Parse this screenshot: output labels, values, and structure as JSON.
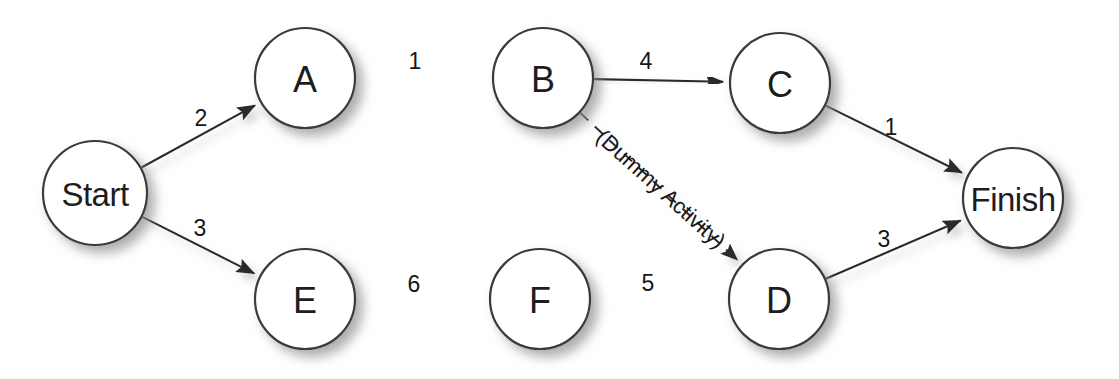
{
  "diagram": {
    "type": "project-network-diagram",
    "title": "",
    "background_color": "#ffffff",
    "node_fill": "#ffffff",
    "node_stroke": "#3a3a3a",
    "edge_color": "#2b2b2b",
    "nodes": [
      {
        "id": "start",
        "label": "Start",
        "cx": 95,
        "cy": 193,
        "r": 52,
        "label_style": "word"
      },
      {
        "id": "a",
        "label": "A",
        "cx": 305,
        "cy": 78,
        "r": 50,
        "label_style": "big"
      },
      {
        "id": "b",
        "label": "B",
        "cx": 543,
        "cy": 78,
        "r": 50,
        "label_style": "big"
      },
      {
        "id": "c",
        "label": "C",
        "cx": 780,
        "cy": 83,
        "r": 50,
        "label_style": "big"
      },
      {
        "id": "e",
        "label": "E",
        "cx": 305,
        "cy": 299,
        "r": 50,
        "label_style": "big"
      },
      {
        "id": "f",
        "label": "F",
        "cx": 540,
        "cy": 299,
        "r": 50,
        "label_style": "big"
      },
      {
        "id": "d",
        "label": "D",
        "cx": 779,
        "cy": 299,
        "r": 50,
        "label_style": "big"
      },
      {
        "id": "finish",
        "label": "Finish",
        "cx": 1013,
        "cy": 198,
        "r": 50,
        "label_style": "word"
      }
    ],
    "edges": [
      {
        "id": "start-a",
        "from": "start",
        "to": "a",
        "label": "2",
        "label_x": 201,
        "label_y": 118,
        "style": "solid"
      },
      {
        "id": "a-b",
        "from": "a",
        "to": "b",
        "label": "1",
        "label_x": 415,
        "label_y": 61,
        "style": "solid"
      },
      {
        "id": "b-c",
        "from": "b",
        "to": "c",
        "label": "4",
        "label_x": 646,
        "label_y": 61,
        "style": "solid"
      },
      {
        "id": "c-finish",
        "from": "c",
        "to": "finish",
        "label": "1",
        "label_x": 891,
        "label_y": 127,
        "style": "solid"
      },
      {
        "id": "start-e",
        "from": "start",
        "to": "e",
        "label": "3",
        "label_x": 200,
        "label_y": 228,
        "style": "solid"
      },
      {
        "id": "e-f",
        "from": "e",
        "to": "f",
        "label": "6",
        "label_x": 414,
        "label_y": 284,
        "style": "solid"
      },
      {
        "id": "f-d",
        "from": "f",
        "to": "d",
        "label": "5",
        "label_x": 648,
        "label_y": 283,
        "style": "solid"
      },
      {
        "id": "d-finish",
        "from": "d",
        "to": "finish",
        "label": "3",
        "label_x": 884,
        "label_y": 239,
        "style": "solid"
      },
      {
        "id": "b-d",
        "from": "b",
        "to": "d",
        "label": "(Dummy Activity)",
        "label_x": 661,
        "label_y": 189,
        "label_rotation": 42,
        "style": "dashed"
      }
    ]
  }
}
